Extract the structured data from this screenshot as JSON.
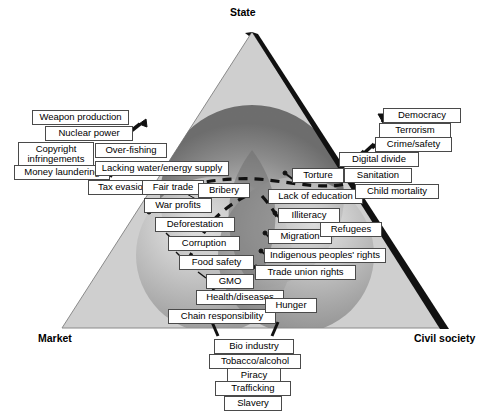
{
  "diagram": {
    "corners": [
      {
        "key": "state",
        "label": "State",
        "x": 230,
        "y": 6
      },
      {
        "key": "market",
        "label": "Market",
        "x": 38,
        "y": 332
      },
      {
        "key": "civil_society",
        "label": "Civil society",
        "x": 414,
        "y": 332
      }
    ],
    "colors": {
      "triangle_fill": "#cfcfcf",
      "triangle_edge_dark": "#111111",
      "sphere_state": "#8d8d8d",
      "sphere_market": "#b9b9b9",
      "sphere_civil": "#9c9c9c",
      "overlap_center": "#6f6f6f",
      "label_border": "#4a4a4a",
      "label_fill": "#ffffff",
      "dashed_curve": "#111111"
    },
    "labels": [
      {
        "key": "weapon-production",
        "text": "Weapon production",
        "x": 32,
        "y": 110,
        "w": 97
      },
      {
        "key": "nuclear-power",
        "text": "Nuclear power",
        "x": 45,
        "y": 126,
        "w": 88
      },
      {
        "key": "copyright-infringements",
        "text": "Copyright infringements",
        "x": 18,
        "y": 142,
        "w": 76,
        "two": true,
        "h": 28
      },
      {
        "key": "over-fishing",
        "text": "Over-fishing",
        "x": 95,
        "y": 143,
        "w": 72
      },
      {
        "key": "money-laundering",
        "text": "Money laundering",
        "x": 14,
        "y": 165,
        "w": 96
      },
      {
        "key": "lacking-water-energy",
        "text": "Lacking water/energy supply",
        "x": 95,
        "y": 161,
        "w": 134
      },
      {
        "key": "tax-evasion",
        "text": "Tax evasion",
        "x": 88,
        "y": 180,
        "w": 70
      },
      {
        "key": "fair-trade",
        "text": "Fair trade",
        "x": 142,
        "y": 180,
        "w": 62
      },
      {
        "key": "bribery",
        "text": "Bribery",
        "x": 198,
        "y": 183,
        "w": 52
      },
      {
        "key": "war-profits",
        "text": "War profits",
        "x": 144,
        "y": 198,
        "w": 68
      },
      {
        "key": "deforestation",
        "text": "Deforestation",
        "x": 155,
        "y": 217,
        "w": 80
      },
      {
        "key": "corruption",
        "text": "Corruption",
        "x": 168,
        "y": 236,
        "w": 72
      },
      {
        "key": "food-safety",
        "text": "Food safety",
        "x": 179,
        "y": 255,
        "w": 75
      },
      {
        "key": "gmo",
        "text": "GMO",
        "x": 206,
        "y": 274,
        "w": 48
      },
      {
        "key": "health-diseases",
        "text": "Health/diseases",
        "x": 196,
        "y": 290,
        "w": 88
      },
      {
        "key": "chain-responsibility",
        "text": "Chain responsibility",
        "x": 168,
        "y": 309,
        "w": 108
      },
      {
        "key": "hunger",
        "text": "Hunger",
        "x": 265,
        "y": 298,
        "w": 52
      },
      {
        "key": "trade-union-rights",
        "text": "Trade union rights",
        "x": 255,
        "y": 265,
        "w": 101
      },
      {
        "key": "indigenous-peoples-rights",
        "text": "Indigenous peoples' rights",
        "x": 264,
        "y": 248,
        "w": 122
      },
      {
        "key": "migration",
        "text": "Migration",
        "x": 268,
        "y": 229,
        "w": 64
      },
      {
        "key": "refugees",
        "text": "Refugees",
        "x": 320,
        "y": 222,
        "w": 62
      },
      {
        "key": "illiteracy",
        "text": "Illiteracy",
        "x": 278,
        "y": 208,
        "w": 62
      },
      {
        "key": "lack-of-education",
        "text": "Lack of education",
        "x": 268,
        "y": 189,
        "w": 95
      },
      {
        "key": "torture",
        "text": "Torture",
        "x": 292,
        "y": 168,
        "w": 52
      },
      {
        "key": "sanitation",
        "text": "Sanitation",
        "x": 344,
        "y": 168,
        "w": 68
      },
      {
        "key": "child-mortality",
        "text": "Child mortality",
        "x": 355,
        "y": 184,
        "w": 84
      },
      {
        "key": "digital-divide",
        "text": "Digital divide",
        "x": 339,
        "y": 152,
        "w": 80
      },
      {
        "key": "crime-safety",
        "text": "Crime/safety",
        "x": 375,
        "y": 137,
        "w": 77
      },
      {
        "key": "terrorism",
        "text": "Terrorism",
        "x": 379,
        "y": 123,
        "w": 72
      },
      {
        "key": "democracy",
        "text": "Democracy",
        "x": 383,
        "y": 108,
        "w": 78
      },
      {
        "key": "bio-industry",
        "text": "Bio industry",
        "x": 214,
        "y": 339,
        "w": 80
      },
      {
        "key": "tobacco-alcohol",
        "text": "Tobacco/alcohol",
        "x": 209,
        "y": 354,
        "w": 92
      },
      {
        "key": "piracy",
        "text": "Piracy",
        "x": 227,
        "y": 368,
        "w": 54
      },
      {
        "key": "trafficking",
        "text": "Trafficking",
        "x": 215,
        "y": 381,
        "w": 76
      },
      {
        "key": "slavery",
        "text": "Slavery",
        "x": 224,
        "y": 396,
        "w": 58
      }
    ]
  }
}
